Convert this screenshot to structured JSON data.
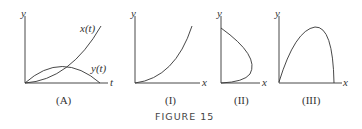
{
  "figure": {
    "caption": "FIGURE 15",
    "panels": [
      {
        "id": "A",
        "label": "(A)",
        "y_axis": "y",
        "x_axis": "t",
        "curves": [
          "x(t)",
          "y(t)"
        ]
      },
      {
        "id": "I",
        "label": "(I)",
        "y_axis": "y",
        "x_axis": "x"
      },
      {
        "id": "II",
        "label": "(II)",
        "y_axis": "y",
        "x_axis": "x"
      },
      {
        "id": "III",
        "label": "(III)",
        "y_axis": "y",
        "x_axis": "x"
      }
    ]
  },
  "colors": {
    "stroke": "#333333",
    "text": "#333333"
  }
}
